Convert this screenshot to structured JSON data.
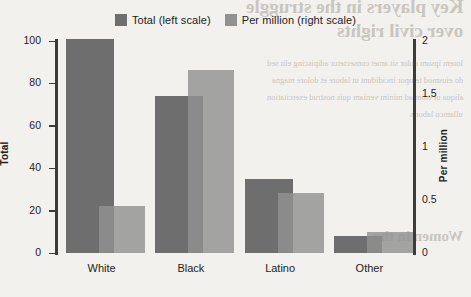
{
  "chart_data": {
    "type": "bar",
    "title": "",
    "subtitle": "",
    "categories": [
      "White",
      "Black",
      "Latino",
      "Other"
    ],
    "series": [
      {
        "name": "Total (left scale)",
        "axis": "left",
        "color": "#6e6e6e",
        "values": [
          101,
          74,
          35,
          8
        ]
      },
      {
        "name": "Per million (right scale)",
        "axis": "right",
        "color": "#919191",
        "values": [
          0.44,
          1.73,
          0.57,
          0.2
        ]
      }
    ],
    "xlabel": "",
    "ylabel": "Total",
    "ylabel_right": "Per million",
    "ylim": [
      0,
      100
    ],
    "ylim_right": [
      0,
      2
    ],
    "yticks": [
      0,
      20,
      40,
      60,
      80,
      100
    ],
    "yticks_right": [
      0,
      0.5,
      1,
      1.5,
      2
    ],
    "ytick_labels": [
      "0",
      "20",
      "40",
      "60",
      "80",
      "100"
    ],
    "ytick_labels_right": [
      "0",
      "0.5",
      "1",
      "1.5",
      "2"
    ],
    "grid": false,
    "legend_position": "top-center",
    "background_color": "#f2f1ee"
  },
  "legend": {
    "items": [
      {
        "label": "Total (left scale)",
        "color": "#6e6e6e"
      },
      {
        "label": "Per million (right scale)",
        "color": "#919191"
      }
    ]
  },
  "axes": {
    "left_title": "Total",
    "right_title": "Per million"
  },
  "bleed_through": {
    "heading_line1": "Key players in the struggle",
    "heading_line2": "over civil rights",
    "body_line1": "lorem ipsum dolor sit amet consectetur adipiscing elit sed",
    "body_line2": "do eiusmod tempor incididunt ut labore et dolore magna",
    "body_line3": "aliqua ut enim ad minim veniam quis nostrud exercitation",
    "body_line4": "ullamco laboris",
    "footer": "Women in the"
  }
}
